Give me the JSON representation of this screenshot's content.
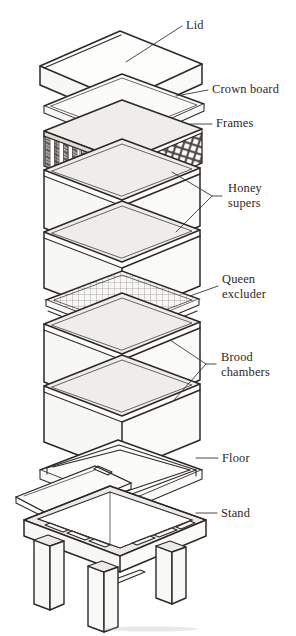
{
  "figure": {
    "type": "technical-line-diagram",
    "background_color": "#ffffff",
    "line_color": "#2c2827",
    "text_color": "#2b2726",
    "width": 296,
    "height": 636
  },
  "labels": [
    {
      "id": "lid",
      "text": "Lid",
      "lines": [
        "Lid"
      ],
      "x": 186,
      "y": 29
    },
    {
      "id": "crown-board",
      "text": "Crown board",
      "lines": [
        "Crown board"
      ],
      "x": 212,
      "y": 93
    },
    {
      "id": "frames",
      "text": "Frames",
      "lines": [
        "Frames"
      ],
      "x": 216,
      "y": 127
    },
    {
      "id": "honey-supers",
      "text": "Honey supers",
      "lines": [
        "Honey",
        "supers"
      ],
      "x": 228,
      "y": 198
    },
    {
      "id": "queen-excluder",
      "text": "Queen excluder",
      "lines": [
        "Queen",
        "excluder"
      ],
      "x": 222,
      "y": 289
    },
    {
      "id": "brood-chambers",
      "text": "Brood chambers",
      "lines": [
        "Brood",
        "chambers"
      ],
      "x": 221,
      "y": 367
    },
    {
      "id": "floor",
      "text": "Floor",
      "lines": [
        "Floor"
      ],
      "x": 222,
      "y": 461
    },
    {
      "id": "stand",
      "text": "Stand",
      "lines": [
        "Stand"
      ],
      "x": 221,
      "y": 516
    }
  ],
  "components": [
    {
      "id": "lid",
      "label": "Lid",
      "order": 1,
      "kind": "solid-box-shallow"
    },
    {
      "id": "crown-board",
      "label": "Crown board",
      "order": 2,
      "kind": "flat-board"
    },
    {
      "id": "frames",
      "label": "Frames",
      "order": 3,
      "kind": "box-with-frames"
    },
    {
      "id": "honey-super-1",
      "label": "Honey super",
      "order": 4,
      "kind": "open-box"
    },
    {
      "id": "honey-super-2",
      "label": "Honey super",
      "order": 5,
      "kind": "open-box"
    },
    {
      "id": "queen-excluder",
      "label": "Queen excluder",
      "order": 6,
      "kind": "flat-grid-plate"
    },
    {
      "id": "brood-chamber-1",
      "label": "Brood chamber",
      "order": 7,
      "kind": "open-box"
    },
    {
      "id": "brood-chamber-2",
      "label": "Brood chamber",
      "order": 8,
      "kind": "open-box"
    },
    {
      "id": "floor",
      "label": "Floor",
      "order": 9,
      "kind": "floor-with-ramp"
    },
    {
      "id": "stand",
      "label": "Stand",
      "order": 10,
      "kind": "four-legged-stand"
    }
  ]
}
